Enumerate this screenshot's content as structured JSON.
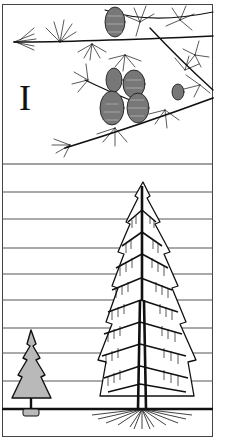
{
  "figure": {
    "panel_label": "I",
    "top_panel": "larch branch with cones",
    "bottom_panel": "height comparison: small tree vs tall larch",
    "colors": {
      "ink": "#111111",
      "line": "#444444",
      "paper": "#ffffff"
    },
    "grid_lines_y": [
      192,
      219,
      248,
      274,
      300,
      328,
      353,
      381
    ],
    "ground_line_y": 409,
    "separator_y": 164
  }
}
